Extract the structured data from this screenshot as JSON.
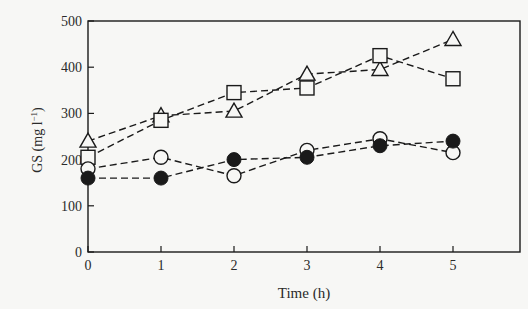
{
  "chart_data": {
    "type": "line",
    "title": "",
    "xlabel": "Time (h)",
    "ylabel": "GS (mg l⁻¹)",
    "ylabel_main": "GS (mg  l",
    "ylabel_sup": "−1",
    "ylabel_close": ")",
    "x": [
      0,
      1,
      2,
      3,
      4,
      5
    ],
    "xlim": [
      0,
      5.9
    ],
    "ylim": [
      0,
      500
    ],
    "xticks": [
      "0",
      "1",
      "2",
      "3",
      "4",
      "5"
    ],
    "yticks": [
      "0",
      "100",
      "200",
      "300",
      "400",
      "500"
    ],
    "grid": false,
    "legend": "none",
    "line_style": "dashed",
    "series": [
      {
        "name": "open-triangle",
        "marker": "triangle-open",
        "values": [
          240,
          295,
          305,
          385,
          395,
          460
        ]
      },
      {
        "name": "open-square",
        "marker": "square-open",
        "values": [
          205,
          285,
          345,
          355,
          425,
          375
        ]
      },
      {
        "name": "open-circle",
        "marker": "circle-open",
        "values": [
          180,
          205,
          165,
          220,
          245,
          215
        ]
      },
      {
        "name": "filled-circle",
        "marker": "circle-filled",
        "values": [
          160,
          160,
          200,
          205,
          230,
          240
        ]
      }
    ]
  },
  "colors": {
    "ink": "#1a1a1a",
    "background": "#f7f7f5"
  }
}
